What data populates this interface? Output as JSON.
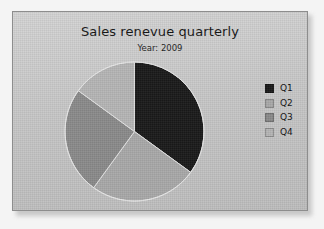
{
  "chart": {
    "title": "Sales renevue quarterly",
    "subtitle": "Year: 2009"
  },
  "legend": {
    "items": [
      {
        "label": "Q1",
        "color": "#1a1a1a"
      },
      {
        "label": "Q2",
        "color": "#a8a8a8"
      },
      {
        "label": "Q3",
        "color": "#8a8a8a"
      },
      {
        "label": "Q4",
        "color": "#b5b5b5"
      }
    ]
  },
  "chart_data": {
    "type": "pie",
    "title": "Sales renevue quarterly",
    "subtitle": "Year: 2009",
    "categories": [
      "Q1",
      "Q2",
      "Q3",
      "Q4"
    ],
    "values": [
      35,
      25,
      25,
      15
    ],
    "unit": "percent",
    "start_angle_deg": 0,
    "direction": "clockwise",
    "slice_angles_deg": [
      126,
      90,
      90,
      54
    ],
    "colors": [
      "#1a1a1a",
      "#a8a8a8",
      "#8a8a8a",
      "#b5b5b5"
    ],
    "legend_position": "right",
    "grid": false,
    "labels_shown": false
  }
}
